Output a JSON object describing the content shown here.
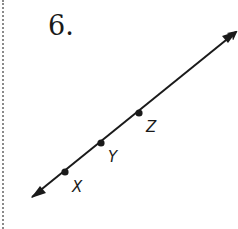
{
  "problem": {
    "number_label": "6."
  },
  "diagram": {
    "type": "line",
    "colors": {
      "stroke": "#1a1a1a",
      "border": "#8a8a8a"
    },
    "line": {
      "start": [
        32,
        197
      ],
      "end": [
        236,
        32
      ]
    },
    "points": [
      {
        "name": "X",
        "label": "X",
        "x": 65,
        "y": 172,
        "label_x": 72,
        "label_y": 192
      },
      {
        "name": "Y",
        "label": "Y",
        "x": 101,
        "y": 143,
        "label_x": 108,
        "label_y": 162
      },
      {
        "name": "Z",
        "label": "Z",
        "x": 139,
        "y": 113,
        "label_x": 146,
        "label_y": 132
      }
    ]
  }
}
